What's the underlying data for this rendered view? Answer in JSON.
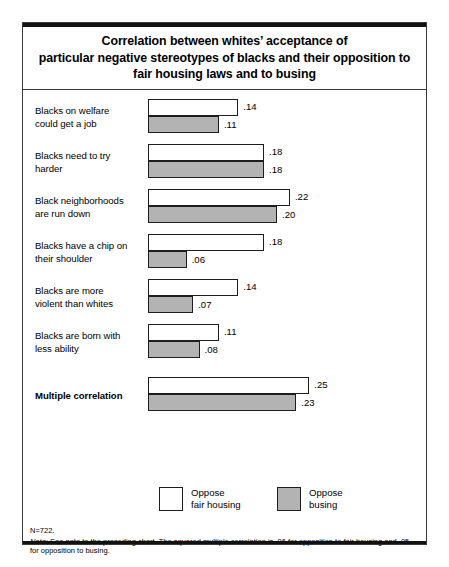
{
  "chart_data": {
    "type": "bar",
    "title_lines": [
      "Correlation between whites’ acceptance of",
      "particular negative stereotypes of blacks and their opposition to",
      "fair housing laws and to busing"
    ],
    "orientation": "horizontal",
    "xlabel": "",
    "ylabel": "",
    "xlim": [
      0,
      0.27
    ],
    "grid": false,
    "legend_position": "bottom",
    "categories": [
      "Blacks on welfare could get a job",
      "Blacks need to try harder",
      "Black neighborhoods are run down",
      "Blacks have a chip on their shoulder",
      "Blacks are more violent than whites",
      "Blacks are born with less ability",
      "Multiple correlation"
    ],
    "series": [
      {
        "name": "Oppose fair housing",
        "color": "#ffffff",
        "values": [
          0.14,
          0.18,
          0.22,
          0.18,
          0.14,
          0.11,
          0.25
        ],
        "labels": [
          ".14",
          ".18",
          ".22",
          ".18",
          ".14",
          ".11",
          ".25"
        ]
      },
      {
        "name": "Oppose busing",
        "color": "#b3b3b3",
        "values": [
          0.11,
          0.18,
          0.2,
          0.06,
          0.07,
          0.08,
          0.23
        ],
        "labels": [
          ".11",
          ".18",
          ".20",
          ".06",
          ".07",
          ".08",
          ".23"
        ]
      }
    ],
    "rows": [
      {
        "label_lines": [
          "Blacks on welfare",
          "could get a job"
        ],
        "bold": false,
        "top_value": 0.14,
        "top_label": ".14",
        "bottom_value": 0.11,
        "bottom_label": ".11"
      },
      {
        "label_lines": [
          "Blacks need to try",
          "harder"
        ],
        "bold": false,
        "top_value": 0.18,
        "top_label": ".18",
        "bottom_value": 0.18,
        "bottom_label": ".18"
      },
      {
        "label_lines": [
          "Black neighborhoods",
          "are run down"
        ],
        "bold": false,
        "top_value": 0.22,
        "top_label": ".22",
        "bottom_value": 0.2,
        "bottom_label": ".20"
      },
      {
        "label_lines": [
          "Blacks have a chip on",
          "their shoulder"
        ],
        "bold": false,
        "top_value": 0.18,
        "top_label": ".18",
        "bottom_value": 0.06,
        "bottom_label": ".06"
      },
      {
        "label_lines": [
          "Blacks are more",
          "violent than whites"
        ],
        "bold": false,
        "top_value": 0.14,
        "top_label": ".14",
        "bottom_value": 0.07,
        "bottom_label": ".07"
      },
      {
        "label_lines": [
          "Blacks are born with",
          "less ability"
        ],
        "bold": false,
        "top_value": 0.11,
        "top_label": ".11",
        "bottom_value": 0.08,
        "bottom_label": ".08"
      },
      {
        "label_lines": [
          "Multiple correlation"
        ],
        "bold": true,
        "top_value": 0.25,
        "top_label": ".25",
        "bottom_value": 0.23,
        "bottom_label": ".23"
      }
    ],
    "legend": [
      {
        "swatch": "white",
        "lines": [
          "Oppose",
          "fair housing"
        ]
      },
      {
        "swatch": "gray",
        "lines": [
          "Oppose",
          "busing"
        ]
      }
    ],
    "footnote": {
      "n_line": "N=722.",
      "note_label": "Note:",
      "note_text": "See note to the preceding chart. The squared multiple correlation is .06 for opposition to fair housing and .05 for opposition to busing."
    }
  }
}
